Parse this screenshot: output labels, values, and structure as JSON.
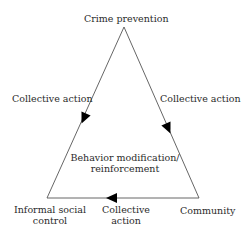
{
  "diagram": {
    "type": "triangle-cycle",
    "nodes": {
      "top": {
        "label": "Crime prevention"
      },
      "bottom_left": {
        "label_line1": "Informal social",
        "label_line2": "control"
      },
      "bottom_right": {
        "label": "Community"
      }
    },
    "edges": {
      "left": {
        "label": "Collective action",
        "direction": "toward bottom_left"
      },
      "right": {
        "label": "Collective action",
        "direction": "toward bottom_right"
      },
      "bottom": {
        "label_line1": "Collective",
        "label_line2": "action",
        "direction": "toward bottom_left"
      }
    },
    "center": {
      "label_line1": "Behavior modification/",
      "label_line2": "reinforcement"
    },
    "colors": {
      "line": "#555555",
      "arrow": "#000000",
      "text": "#2b2b2b"
    }
  }
}
